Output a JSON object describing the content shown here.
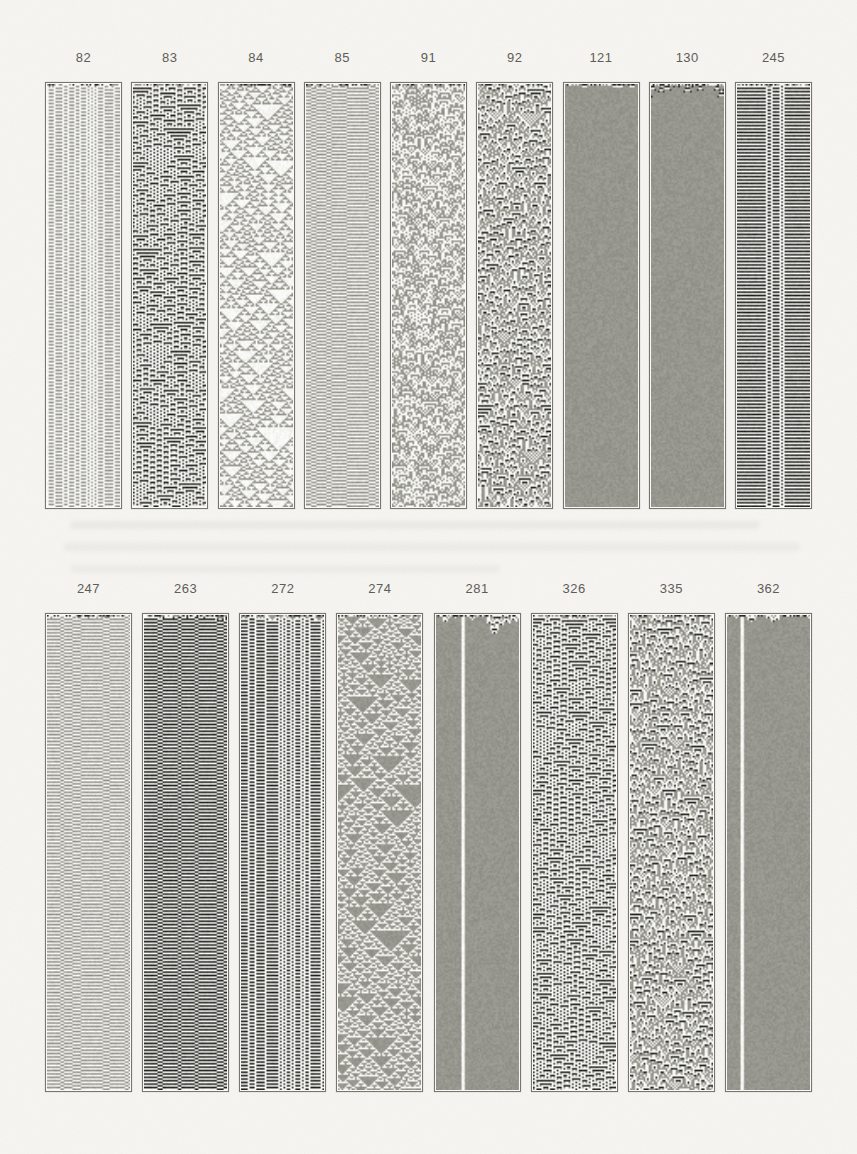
{
  "page": {
    "background": "#f7f6f2",
    "frame_border_color": "#75746d",
    "label_color": "#5b5a55"
  },
  "figure": {
    "kind": "cellular-automaton-strips",
    "ca_palette": [
      "#fbfbf8",
      "#97968e",
      "#22221e"
    ],
    "rows": [
      {
        "name": "top",
        "strips": [
          {
            "code": "82"
          },
          {
            "code": "83"
          },
          {
            "code": "84"
          },
          {
            "code": "85"
          },
          {
            "code": "91"
          },
          {
            "code": "92"
          },
          {
            "code": "121"
          },
          {
            "code": "130"
          },
          {
            "code": "245"
          }
        ]
      },
      {
        "name": "bottom",
        "strips": [
          {
            "code": "247"
          },
          {
            "code": "263"
          },
          {
            "code": "272"
          },
          {
            "code": "274"
          },
          {
            "code": "281"
          },
          {
            "code": "326"
          },
          {
            "code": "335"
          },
          {
            "code": "362"
          }
        ]
      }
    ]
  }
}
